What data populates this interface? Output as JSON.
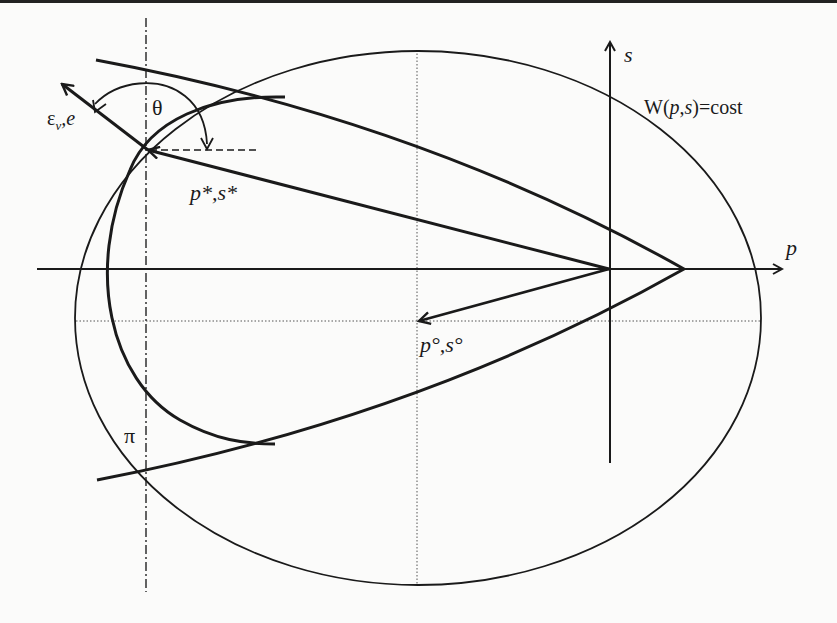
{
  "figure": {
    "colors": {
      "ink": "#1a1a1a",
      "background": "#fbfbfa",
      "dotted": "#555555"
    }
  },
  "axes": {
    "p_label": "p",
    "s_label": "s"
  },
  "labels": {
    "level_set": "W(p,s)=cost",
    "optimal_point": "p*,s*",
    "initial_point": "p°,s°",
    "direction_eps": "ε",
    "direction_eps_sub": "ν",
    "direction_e": ",e",
    "angle": "θ",
    "pi": "π"
  }
}
